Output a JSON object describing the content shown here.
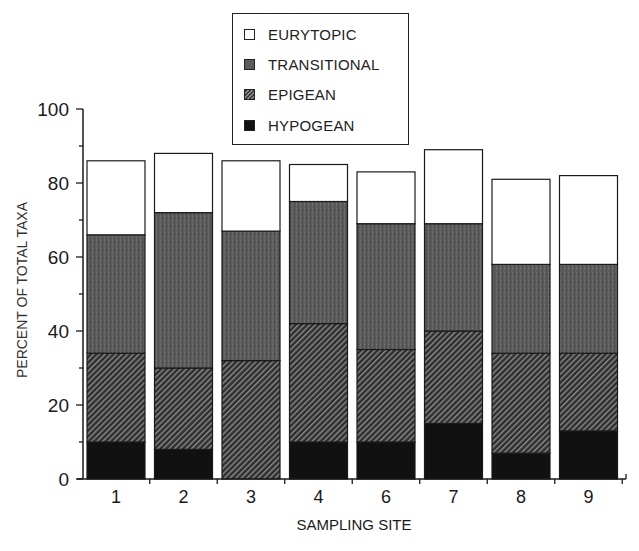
{
  "chart_data": {
    "type": "bar",
    "stacked": true,
    "title": "",
    "xlabel": "SAMPLING SITE",
    "ylabel": "PERCENT OF TOTAL TAXA",
    "ylim": [
      0,
      100
    ],
    "yticks": [
      0,
      20,
      40,
      60,
      80,
      100
    ],
    "grid": false,
    "legend_position": "top-center",
    "categories": [
      "1",
      "2",
      "3",
      "4",
      "6",
      "7",
      "8",
      "9"
    ],
    "series": [
      {
        "name": "HYPOGEAN",
        "fill": "solid-black",
        "values": [
          10,
          8,
          0,
          10,
          10,
          15,
          7,
          13
        ]
      },
      {
        "name": "EPIGEAN",
        "fill": "diagonal-hatch",
        "values": [
          24,
          22,
          32,
          32,
          25,
          25,
          27,
          21
        ]
      },
      {
        "name": "TRANSITIONAL",
        "fill": "stipple-grey",
        "values": [
          32,
          42,
          35,
          33,
          34,
          29,
          24,
          24
        ]
      },
      {
        "name": "EURYTOPIC",
        "fill": "white",
        "values": [
          20,
          16,
          19,
          10,
          14,
          20,
          23,
          24
        ]
      }
    ],
    "totals": [
      86,
      88,
      86,
      85,
      83,
      89,
      81,
      82
    ]
  },
  "legend": {
    "items": [
      {
        "label": "EURYTOPIC",
        "swatch": "sw-eurytopic"
      },
      {
        "label": "TRANSITIONAL",
        "swatch": "sw-transitional"
      },
      {
        "label": "EPIGEAN",
        "swatch": "sw-epigean"
      },
      {
        "label": "HYPOGEAN",
        "swatch": "sw-hypogean"
      }
    ]
  },
  "colors": {
    "axis": "#1a1a1a",
    "eurytopic": "#ffffff",
    "transitional": "#5c5c5c",
    "epigean_dark": "#2e2e2e",
    "epigean_light": "#8c8c8c",
    "hypogean": "#111111"
  }
}
